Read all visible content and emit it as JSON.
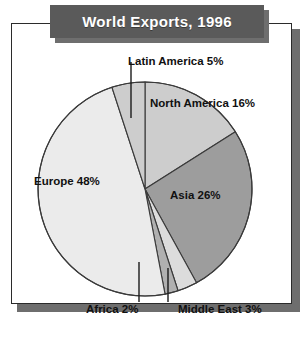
{
  "title": "World Exports, 1996",
  "colors": {
    "banner_bg": "#5a5a5a",
    "banner_text": "#ffffff",
    "shadow": "#6e6e6e",
    "frame_border": "#2b2b2b",
    "page_bg": "#ffffff",
    "slice_stroke": "#3a3a3a"
  },
  "labels": {
    "latin_america": "Latin America 5%",
    "north_america": "North America 16%",
    "europe": "Europe 48%",
    "asia": "Asia 26%",
    "africa": "Africa 2%",
    "middle_east": "Middle East 3%"
  },
  "chart_data": {
    "type": "pie",
    "title": "World Exports, 1996",
    "xlabel": "",
    "ylabel": "",
    "units": "percent",
    "total": 100,
    "start_angle_deg": 0,
    "direction": "clockwise",
    "legend": "none (direct labels with leader lines)",
    "grid": false,
    "categories": [
      "North America",
      "Asia",
      "Middle East",
      "Africa",
      "Europe",
      "Latin America"
    ],
    "values": [
      16,
      26,
      3,
      2,
      48,
      5
    ],
    "slices": [
      {
        "name": "North America",
        "value": 16,
        "label": "North America 16%",
        "color": "#cdcdcd",
        "leader_line": false
      },
      {
        "name": "Asia",
        "value": 26,
        "label": "Asia 26%",
        "color": "#9d9d9d",
        "leader_line": false
      },
      {
        "name": "Middle East",
        "value": 3,
        "label": "Middle East 3%",
        "color": "#dcdcdc",
        "leader_line": true
      },
      {
        "name": "Africa",
        "value": 2,
        "label": "Africa 2%",
        "color": "#b0b0b0",
        "leader_line": true
      },
      {
        "name": "Europe",
        "value": 48,
        "label": "Europe 48%",
        "color": "#ebebeb",
        "leader_line": false
      },
      {
        "name": "Latin America",
        "value": 5,
        "label": "Latin America 5%",
        "color": "#cdcdcd",
        "leader_line": true
      }
    ]
  }
}
